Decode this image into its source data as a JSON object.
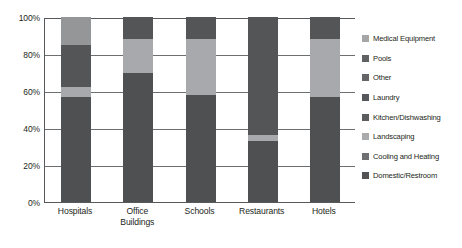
{
  "chart_data": {
    "type": "bar",
    "subtype": "stacked-100-percent",
    "title": "",
    "xlabel": "",
    "ylabel": "",
    "ylim": [
      0,
      100
    ],
    "ytick_labels": [
      "100%",
      "80%",
      "60%",
      "40%",
      "20%",
      "0%"
    ],
    "ytick_values": [
      100,
      80,
      60,
      40,
      20,
      0
    ],
    "grid": true,
    "grid_axis": "y",
    "legend_position": "right",
    "categories": [
      "Hospitals",
      "Office\nBuildings",
      "Schools",
      "Restaurants",
      "Hotels"
    ],
    "category_labels": [
      "Hospitals",
      "Office Buildings",
      "Schools",
      "Restaurants",
      "Hotels"
    ],
    "series": [
      {
        "name": "Domestic/Restroom",
        "color": "#4f5052",
        "values": [
          57,
          70,
          58,
          33,
          57
        ]
      },
      {
        "name": "Cooling and Heating",
        "color": "#6d6e70",
        "values": [
          0,
          0,
          0,
          0,
          0
        ]
      },
      {
        "name": "Landscaping",
        "color": "#a7a9ac",
        "values": [
          5,
          18,
          30,
          3,
          31
        ]
      },
      {
        "name": "Kitchen/Dishwashing",
        "color": "#58595b",
        "values": [
          0,
          0,
          0,
          0,
          0
        ]
      },
      {
        "name": "Laundry",
        "color": "#545557",
        "values": [
          23,
          12,
          12,
          64,
          12
        ]
      },
      {
        "name": "Other",
        "color": "#68696b",
        "values": [
          0,
          0,
          0,
          0,
          0
        ]
      },
      {
        "name": "Pools",
        "color": "#5f6062",
        "values": [
          0,
          0,
          0,
          0,
          0
        ]
      },
      {
        "name": "Medical Equipment",
        "color": "#949698",
        "values": [
          15,
          0,
          0,
          0,
          0
        ]
      }
    ]
  },
  "legend": {
    "items": [
      {
        "label": "Medical Equipment",
        "color": "#a4a6a8"
      },
      {
        "label": "Pools",
        "color": "#5f6163"
      },
      {
        "label": "Other",
        "color": "#646567"
      },
      {
        "label": "Laundry",
        "color": "#56575a"
      },
      {
        "label": "Kitchen/Dishwashing",
        "color": "#5b5c5e"
      },
      {
        "label": "Landscaping",
        "color": "#a9abad"
      },
      {
        "label": "Cooling and Heating",
        "color": "#6f7072"
      },
      {
        "label": "Domestic/Restroom",
        "color": "#515355"
      }
    ]
  },
  "axis": {
    "line_color": "#58595b",
    "grid_color": "#6d6e71",
    "text_color": "#231f20"
  }
}
